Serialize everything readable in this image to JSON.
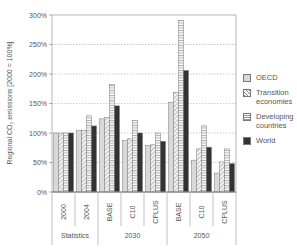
{
  "chart_data": {
    "type": "bar",
    "title": "",
    "xlabel": "",
    "ylabel": "Regional CO2 emissions [2000 = 100%]",
    "ylabel_display": "Regional CO₂ emissions [2000 = 100%]",
    "ylim": [
      0,
      300
    ],
    "yticks": [
      "0%",
      "50%",
      "100%",
      "150%",
      "200%",
      "250%",
      "300%"
    ],
    "grid": "dotted horizontal",
    "legend_position": "right",
    "categories": [
      "2000",
      "2004",
      "BASE",
      "C10",
      "CPLUS",
      "BASE",
      "C10",
      "CPLUS"
    ],
    "category_groups": [
      {
        "label": "Statistics",
        "span": [
          0,
          1
        ]
      },
      {
        "label": "2030",
        "span": [
          2,
          4
        ]
      },
      {
        "label": "2050",
        "span": [
          5,
          7
        ]
      }
    ],
    "series": [
      {
        "name": "OECD",
        "pattern": "light-gray",
        "values": [
          100,
          104,
          124,
          87,
          79,
          152,
          54,
          32
        ]
      },
      {
        "name": "Transition economies",
        "pattern": "diagonal-hatch",
        "values": [
          100,
          104,
          126,
          90,
          80,
          169,
          73,
          51
        ]
      },
      {
        "name": "Developing countries",
        "pattern": "horizontal-lines",
        "values": [
          100,
          129,
          182,
          121,
          100,
          291,
          112,
          73
        ]
      },
      {
        "name": "World",
        "pattern": "dark-solid",
        "values": [
          100,
          112,
          146,
          100,
          86,
          206,
          76,
          48
        ]
      }
    ]
  },
  "legend": {
    "items": [
      {
        "label": "OECD"
      },
      {
        "label": "Transition economies"
      },
      {
        "label": "Developing countries"
      },
      {
        "label": "World"
      }
    ]
  }
}
